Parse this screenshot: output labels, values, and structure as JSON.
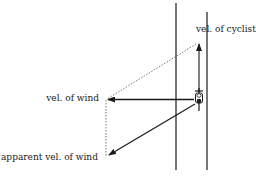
{
  "diagram": {
    "labels": {
      "cyclist_velocity": "vel. of cyclist",
      "wind_velocity": "vel. of wind",
      "apparent_wind_velocity": "apparent vel. of wind"
    },
    "elements": [
      {
        "type": "road-edge",
        "count": 2,
        "orientation": "vertical"
      },
      {
        "type": "cyclist-icon",
        "direction": "up"
      },
      {
        "type": "arrow",
        "meaning": "velocity of cyclist",
        "direction": "up"
      },
      {
        "type": "arrow",
        "meaning": "velocity of wind",
        "direction": "left"
      },
      {
        "type": "arrow",
        "meaning": "apparent velocity of wind",
        "direction": "down-left"
      },
      {
        "type": "dotted-line",
        "meaning": "parallelogram construction",
        "count": 2
      }
    ],
    "colors": {
      "ink": "#1a1a1a",
      "background": "#ffffff"
    }
  }
}
